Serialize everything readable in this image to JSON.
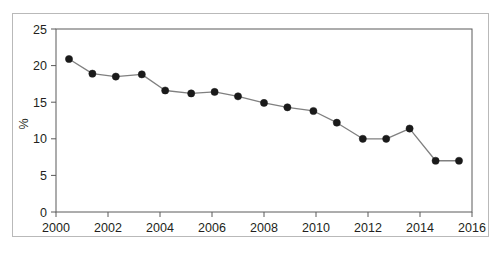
{
  "chart_data": {
    "type": "line",
    "title": "",
    "subtitle": "",
    "xlabel": "",
    "ylabel": "%",
    "xlim": [
      2000,
      2016
    ],
    "ylim": [
      0,
      25
    ],
    "grid": false,
    "legend": null,
    "legend_position": "none",
    "xticks": [
      2000,
      2002,
      2004,
      2006,
      2008,
      2010,
      2012,
      2014,
      2016
    ],
    "xtick_labels": [
      "2000",
      "2002",
      "2004",
      "2006",
      "2008",
      "2010",
      "2012",
      "2014",
      "2016"
    ],
    "yticks": [
      0,
      5,
      10,
      15,
      20,
      25
    ],
    "ytick_labels": [
      "0",
      "5",
      "10",
      "15",
      "20",
      "25"
    ],
    "marker": "filled-circle",
    "marker_color": "#1a1a1a",
    "line_color": "#808080",
    "x": [
      2000.5,
      2001.4,
      2002.3,
      2003.3,
      2004.2,
      2005.2,
      2006.1,
      2007.0,
      2008.0,
      2008.9,
      2009.9,
      2010.8,
      2011.8,
      2012.7,
      2013.6,
      2014.6,
      2015.5
    ],
    "values": [
      20.9,
      18.9,
      18.5,
      18.8,
      16.6,
      16.2,
      16.4,
      15.8,
      14.9,
      14.3,
      13.8,
      12.2,
      10.0,
      10.0,
      11.4,
      7.0,
      7.0
    ],
    "series": [
      {
        "name": "",
        "x": [
          2000.5,
          2001.4,
          2002.3,
          2003.3,
          2004.2,
          2005.2,
          2006.1,
          2007.0,
          2008.0,
          2008.9,
          2009.9,
          2010.8,
          2011.8,
          2012.7,
          2013.6,
          2014.6,
          2015.5
        ],
        "values": [
          20.9,
          18.9,
          18.5,
          18.8,
          16.6,
          16.2,
          16.4,
          15.8,
          14.9,
          14.3,
          13.8,
          12.2,
          10.0,
          10.0,
          11.4,
          7.0,
          7.0
        ]
      }
    ],
    "annotations": []
  }
}
